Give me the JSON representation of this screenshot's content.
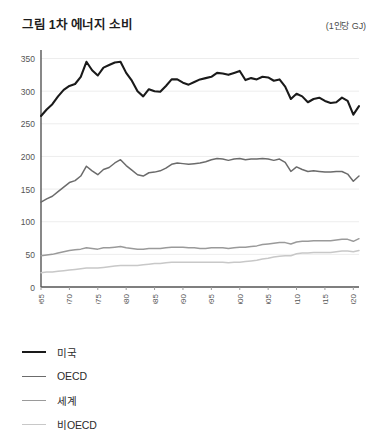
{
  "header": {
    "title": "그림 1차 에너지 소비",
    "unit": "(1인당 GJ)"
  },
  "legend": {
    "items": [
      {
        "label": "미국",
        "color": "#1a1a1a",
        "width": 2.2
      },
      {
        "label": "OECD",
        "color": "#6b6b6b",
        "width": 1.8
      },
      {
        "label": "세계",
        "color": "#9a9a9a",
        "width": 1.8
      },
      {
        "label": "비OECD",
        "color": "#c8c8c8",
        "width": 1.8
      }
    ]
  },
  "chart_data": {
    "type": "line",
    "title": "그림 1차 에너지 소비",
    "xlabel": "",
    "ylabel": "",
    "unit": "(1인당 GJ)",
    "grid": true,
    "legend_position": "below-left",
    "xlim": [
      1965,
      2021
    ],
    "ylim": [
      0,
      360
    ],
    "yticks": [
      0,
      50,
      100,
      150,
      200,
      250,
      300,
      350
    ],
    "xticks": [
      1965,
      1970,
      1975,
      1980,
      1985,
      1990,
      1995,
      2000,
      2005,
      2010,
      2015,
      2020
    ],
    "xtick_rotation": -90,
    "x": [
      1965,
      1966,
      1967,
      1968,
      1969,
      1970,
      1971,
      1972,
      1973,
      1974,
      1975,
      1976,
      1977,
      1978,
      1979,
      1980,
      1981,
      1982,
      1983,
      1984,
      1985,
      1986,
      1987,
      1988,
      1989,
      1990,
      1991,
      1992,
      1993,
      1994,
      1995,
      1996,
      1997,
      1998,
      1999,
      2000,
      2001,
      2002,
      2003,
      2004,
      2005,
      2006,
      2007,
      2008,
      2009,
      2010,
      2011,
      2012,
      2013,
      2014,
      2015,
      2016,
      2017,
      2018,
      2019,
      2020,
      2021
    ],
    "series": [
      {
        "name": "미국",
        "color": "#1a1a1a",
        "values": [
          262,
          272,
          280,
          292,
          302,
          308,
          311,
          322,
          345,
          332,
          324,
          336,
          340,
          344,
          345,
          328,
          316,
          300,
          292,
          303,
          300,
          299,
          308,
          318,
          318,
          313,
          310,
          314,
          318,
          320,
          322,
          328,
          327,
          325,
          328,
          331,
          317,
          320,
          318,
          322,
          321,
          316,
          318,
          307,
          288,
          296,
          292,
          283,
          288,
          290,
          285,
          282,
          283,
          290,
          285,
          264,
          277
        ]
      },
      {
        "name": "OECD",
        "color": "#6b6b6b",
        "values": [
          130,
          135,
          139,
          146,
          153,
          160,
          163,
          170,
          185,
          178,
          172,
          180,
          183,
          190,
          195,
          186,
          179,
          172,
          170,
          175,
          176,
          178,
          182,
          188,
          190,
          189,
          188,
          189,
          190,
          192,
          195,
          197,
          196,
          194,
          196,
          197,
          195,
          196,
          196,
          197,
          196,
          194,
          196,
          191,
          177,
          184,
          180,
          177,
          178,
          177,
          176,
          176,
          177,
          177,
          173,
          162,
          170
        ]
      },
      {
        "name": "세계",
        "color": "#9a9a9a",
        "values": [
          48,
          49,
          50,
          52,
          54,
          56,
          57,
          58,
          60,
          59,
          58,
          60,
          60,
          61,
          62,
          60,
          59,
          58,
          58,
          59,
          59,
          59,
          60,
          61,
          61,
          61,
          60,
          60,
          59,
          59,
          60,
          60,
          60,
          59,
          60,
          61,
          61,
          62,
          63,
          65,
          66,
          67,
          68,
          68,
          66,
          69,
          70,
          70,
          71,
          71,
          71,
          71,
          72,
          73,
          73,
          70,
          74
        ]
      },
      {
        "name": "비OECD",
        "color": "#c8c8c8",
        "values": [
          22,
          23,
          23,
          24,
          25,
          26,
          27,
          28,
          29,
          29,
          29,
          30,
          31,
          32,
          33,
          33,
          33,
          33,
          34,
          35,
          36,
          36,
          37,
          38,
          38,
          38,
          38,
          38,
          38,
          38,
          38,
          38,
          38,
          37,
          38,
          38,
          39,
          40,
          41,
          43,
          44,
          46,
          47,
          48,
          48,
          51,
          52,
          52,
          53,
          53,
          53,
          53,
          54,
          55,
          55,
          54,
          56
        ]
      }
    ]
  }
}
